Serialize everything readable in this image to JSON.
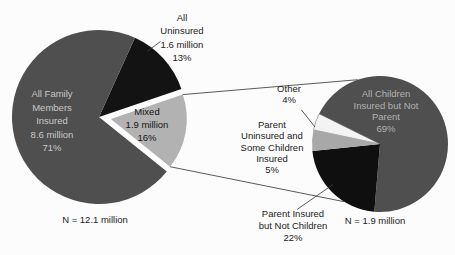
{
  "chart_data": [
    {
      "type": "pie",
      "n_label": "N = 12.1 million",
      "legend_position": "none",
      "slices": [
        {
          "name": "All Uninsured",
          "value": "1.6 million",
          "percent": 13,
          "color": "#131313"
        },
        {
          "name": "Mixed",
          "value": "1.9 million",
          "percent": 16,
          "color": "#b2b2b2",
          "exploded": true
        },
        {
          "name": "All Family Members Insured",
          "value": "8.6 million",
          "percent": 71,
          "color": "#4f4f4f"
        }
      ]
    },
    {
      "type": "pie",
      "n_label": "N = 1.9 million",
      "legend_position": "none",
      "slices": [
        {
          "name": "Other",
          "percent": 4,
          "color": "#f3f3f3",
          "stroke": "#9b9b9b"
        },
        {
          "name": "All Children Insured but Not Parent",
          "percent": 69,
          "color": "#4f4f4f"
        },
        {
          "name": "Parent Insured but Not Children",
          "percent": 22,
          "color": "#0f0f0f"
        },
        {
          "name": "Parent Uninsured and Some Children Insured",
          "percent": 5,
          "color": "#a8a8a8"
        }
      ]
    }
  ],
  "labels": {
    "left_inside": [
      "All Family",
      "Members",
      "Insured",
      "8.6 million",
      "71%"
    ],
    "left_black": [
      "All",
      "Uninsured",
      "1.6 million",
      "13%"
    ],
    "left_mixed": [
      "Mixed",
      "1.9 million",
      "16%"
    ],
    "left_n": "N = 12.1 million",
    "right_inside": [
      "All Children",
      "Insured but Not",
      "Parent",
      "69%"
    ],
    "right_other": [
      "Other",
      "4%"
    ],
    "right_lightgray": [
      "Parent",
      "Uninsured and",
      "Some Children",
      "Insured",
      "5%"
    ],
    "right_black": [
      "Parent Insured",
      "but Not Children",
      "22%"
    ],
    "right_n": "N = 1.9 million"
  },
  "colors": {
    "dark_gray_slice": "#4f4f4f",
    "black_slice": "#131313",
    "light_gray_slice": "#b2b2b2",
    "white_slice": "#f3f3f3",
    "line": "#3c3c3c",
    "background": "#fcfcfc"
  }
}
